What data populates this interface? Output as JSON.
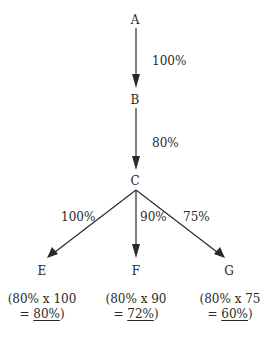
{
  "nodes": {
    "A": "A",
    "B": "B",
    "C": "C",
    "E": "E",
    "F": "F",
    "G": "G"
  },
  "edges": {
    "a_b": "100%",
    "b_c": "80%",
    "c_e": "100%",
    "c_f": "90%",
    "c_g": "75%"
  },
  "results": {
    "E": {
      "line1": "(80% x 100",
      "prefix": "= ",
      "value": "80%",
      "suffix": ")"
    },
    "F": {
      "line1": "(80% x 90",
      "prefix": "= ",
      "value": "72%",
      "suffix": ")"
    },
    "G": {
      "line1": "(80% x 75",
      "prefix": "= ",
      "value": "60%",
      "suffix": ")"
    }
  },
  "colors": {
    "line": "#2a2a2a",
    "text": "#2a2a2a",
    "background": "#ffffff"
  }
}
